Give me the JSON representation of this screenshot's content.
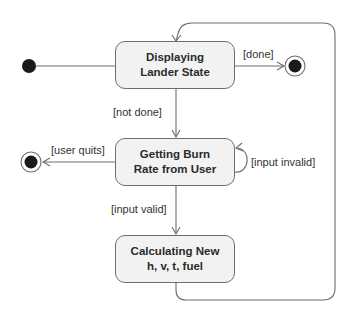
{
  "diagram": {
    "type": "UML state machine",
    "colors": {
      "line": "#6e6e6e",
      "state_fill": "#f2f2f2",
      "node_fill": "#1a1a1a",
      "text": "#2a2a2a"
    },
    "states": [
      {
        "id": "displaying",
        "line1": "Displaying",
        "line2": "Lander State"
      },
      {
        "id": "getting",
        "line1": "Getting Burn",
        "line2": "Rate from User"
      },
      {
        "id": "calculating",
        "line1": "Calculating New",
        "line2": "h, v, t, fuel"
      }
    ],
    "pseudostates": {
      "initial": "initial-state",
      "finals": [
        "final-state-done",
        "final-state-quit"
      ]
    },
    "transitions": [
      {
        "from": "initial",
        "to": "displaying",
        "guard": ""
      },
      {
        "from": "displaying",
        "to": "final-state-done",
        "guard": "[done]"
      },
      {
        "from": "displaying",
        "to": "getting",
        "guard": "[not done]"
      },
      {
        "from": "getting",
        "to": "final-state-quit",
        "guard": "[user quits]"
      },
      {
        "from": "getting",
        "to": "getting",
        "guard": "[input invalid]"
      },
      {
        "from": "getting",
        "to": "calculating",
        "guard": "[input valid]"
      },
      {
        "from": "calculating",
        "to": "displaying",
        "guard": ""
      }
    ]
  }
}
